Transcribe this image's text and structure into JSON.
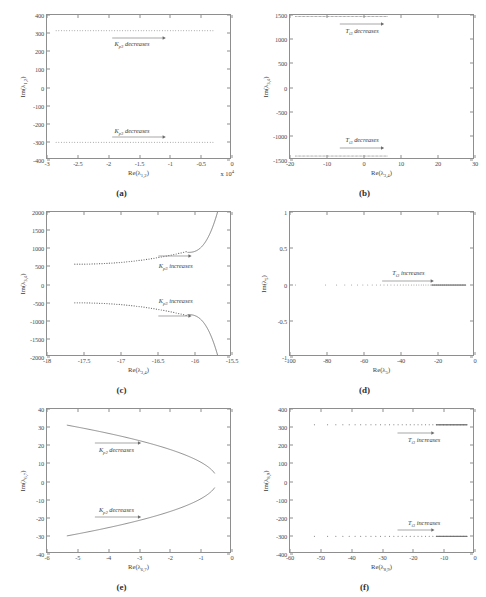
{
  "figure": {
    "panel_count": 6,
    "background": "#ffffff",
    "curve_color": "#6b6b6b",
    "axis_color": "#8e8e8e"
  },
  "panels": [
    {
      "caption": "(a)",
      "xlabel_html": "Re(&lambda;<sub>1,2</sub>)",
      "ylabel_html": "Im(&lambda;<sub>1,2</sub>)",
      "multiplier": "x 10",
      "multiplier_exp": "4",
      "xlim": [
        -3,
        0
      ],
      "ylim": [
        -400,
        400
      ],
      "xticks": [
        -3,
        -2.5,
        -2,
        -1.5,
        -1,
        -0.5,
        0
      ],
      "xticklabels": [
        "-3",
        "-2.5",
        "-2",
        "-1.5",
        "-1",
        "-0.5",
        "0"
      ],
      "yticks": [
        -400,
        -300,
        -200,
        -100,
        0,
        100,
        200,
        300,
        400
      ],
      "yticklabels": [
        "-400",
        "-300",
        "-200",
        "-100",
        "0",
        "100",
        "200",
        "300",
        "400"
      ],
      "annotations": [
        {
          "text_html": "K<sub>p3</sub> decreases",
          "x": -1.62,
          "y": 238,
          "arrow_from_x": -1.95,
          "arrow_to_x": -1.08,
          "arrow_y": 272
        },
        {
          "text_html": "K<sub>p3</sub> decreases",
          "x": -1.62,
          "y": -238,
          "arrow_from_x": -1.95,
          "arrow_to_x": -1.08,
          "arrow_y": -272
        }
      ]
    },
    {
      "caption": "(b)",
      "xlabel_html": "Re(&lambda;<sub>3,4</sub>)",
      "ylabel_html": "Im(&lambda;<sub>3,4</sub>)",
      "multiplier": "",
      "multiplier_exp": "",
      "xlim": [
        -20,
        30
      ],
      "ylim": [
        -1500,
        1500
      ],
      "xticks": [
        -20,
        -10,
        0,
        10,
        20,
        30
      ],
      "xticklabels": [
        "-20",
        "-10",
        "0",
        "10",
        "20",
        "30"
      ],
      "yticks": [
        -1500,
        -1000,
        -500,
        0,
        500,
        1000,
        1500
      ],
      "yticklabels": [
        "-1500",
        "-1000",
        "-500",
        "0",
        "500",
        "1000",
        "1500"
      ],
      "annotations": [
        {
          "text_html": "T<sub>i3</sub> decreases",
          "x": -0.5,
          "y": 1160,
          "arrow_from_x": -6.5,
          "arrow_to_x": 5.5,
          "arrow_y": 1310
        },
        {
          "text_html": "T<sub>i3</sub> decreases",
          "x": -0.5,
          "y": -1090,
          "arrow_from_x": -6.5,
          "arrow_to_x": 5.5,
          "arrow_y": -1245
        }
      ]
    },
    {
      "caption": "(c)",
      "xlabel_html": "Re(&lambda;<sub>3,4</sub>)",
      "ylabel_html": "Im(&lambda;<sub>3,4</sub>)",
      "multiplier": "",
      "multiplier_exp": "",
      "xlim": [
        -18,
        -15.5
      ],
      "ylim": [
        -2000,
        2000
      ],
      "xticks": [
        -18,
        -17.5,
        -17,
        -16.5,
        -16,
        -15.5
      ],
      "xticklabels": [
        "-18",
        "-17.5",
        "-17",
        "-16.5",
        "-16",
        "-15.5"
      ],
      "yticks": [
        -2000,
        -1500,
        -1000,
        -500,
        0,
        500,
        1000,
        1500,
        2000
      ],
      "yticklabels": [
        "-2000",
        "-1500",
        "-1000",
        "-500",
        "0",
        "500",
        "1000",
        "1500",
        "2000"
      ],
      "annotations": [
        {
          "text_html": "K<sub>p3</sub> increases",
          "x": -16.26,
          "y": 510,
          "arrow_from_x": -16.5,
          "arrow_to_x": -16.05,
          "arrow_y": 800
        },
        {
          "text_html": "K<sub>p3</sub> increases",
          "x": -16.26,
          "y": -455,
          "arrow_from_x": -16.5,
          "arrow_to_x": -16.05,
          "arrow_y": -880
        }
      ]
    },
    {
      "caption": "(d)",
      "xlabel_html": "Re(&lambda;<sub>5</sub>)",
      "ylabel_html": "Im(&lambda;<sub>5</sub>)",
      "multiplier": "",
      "multiplier_exp": "",
      "xlim": [
        -100,
        0
      ],
      "ylim": [
        -1,
        1
      ],
      "xticks": [
        -100,
        -80,
        -60,
        -40,
        -20,
        0
      ],
      "xticklabels": [
        "-100",
        "-80",
        "-60",
        "-40",
        "-20",
        "0"
      ],
      "yticks": [
        -1,
        -0.5,
        0,
        0.5,
        1
      ],
      "yticklabels": [
        "-1",
        "-0.5",
        "0",
        "0.5",
        "1"
      ],
      "annotations": [
        {
          "text_html": "T<sub>i3</sub> increases",
          "x": -36,
          "y": 0.155,
          "arrow_from_x": -50,
          "arrow_to_x": -22,
          "arrow_y": 0.055
        }
      ]
    },
    {
      "caption": "(e)",
      "xlabel_html": "Re(&lambda;<sub>6,7</sub>)",
      "ylabel_html": "Im(&lambda;<sub>6,7</sub>)",
      "multiplier": "",
      "multiplier_exp": "",
      "xlim": [
        -6,
        0
      ],
      "ylim": [
        -40,
        40
      ],
      "xticks": [
        -6,
        -5,
        -4,
        -3,
        -2,
        -1,
        0
      ],
      "xticklabels": [
        "-6",
        "-5",
        "-4",
        "-3",
        "-2",
        "-1",
        "0"
      ],
      "yticks": [
        -40,
        -30,
        -20,
        -10,
        0,
        10,
        20,
        30,
        40
      ],
      "yticklabels": [
        "-40",
        "-30",
        "-20",
        "-10",
        "0",
        "10",
        "20",
        "30",
        "40"
      ],
      "annotations": [
        {
          "text_html": "K<sub>p2</sub> decreases",
          "x": -3.75,
          "y": 17.5,
          "arrow_from_x": -4.45,
          "arrow_to_x": -2.95,
          "arrow_y": 21.5
        },
        {
          "text_html": "K<sub>p2</sub> decreases",
          "x": -3.75,
          "y": -15.5,
          "arrow_from_x": -4.45,
          "arrow_to_x": -2.95,
          "arrow_y": -19.5
        }
      ]
    },
    {
      "caption": "(f)",
      "xlabel_html": "Re(&lambda;<sub>8,9</sub>)",
      "ylabel_html": "Im(&lambda;<sub>8,9</sub>)",
      "multiplier": "",
      "multiplier_exp": "",
      "xlim": [
        -60,
        0
      ],
      "ylim": [
        -400,
        400
      ],
      "xticks": [
        -60,
        -50,
        -40,
        -30,
        -20,
        -10,
        0
      ],
      "xticklabels": [
        "-60",
        "-50",
        "-40",
        "-30",
        "-20",
        "-10",
        "0"
      ],
      "yticks": [
        -400,
        -300,
        -200,
        -100,
        0,
        100,
        200,
        300,
        400
      ],
      "yticklabels": [
        "-400",
        "-300",
        "-200",
        "-100",
        "0",
        "100",
        "200",
        "300",
        "400"
      ],
      "annotations": [
        {
          "text_html": "T<sub>i3</sub> increases",
          "x": -16.5,
          "y": 228,
          "arrow_from_x": -25,
          "arrow_to_x": -13,
          "arrow_y": 265
        },
        {
          "text_html": "T<sub>i3</sub> increases",
          "x": -16.5,
          "y": -228,
          "arrow_from_x": -25,
          "arrow_to_x": -13,
          "arrow_y": -265
        }
      ]
    }
  ],
  "chart_data": [
    {
      "panel": "(a)",
      "type": "scatter",
      "title": "",
      "xlabel": "Re(lambda_1,2)  x 10^4",
      "ylabel": "Im(lambda_1,2)",
      "xlim": [
        -3,
        0
      ],
      "ylim": [
        -400,
        400
      ],
      "grid": false,
      "legend": "none",
      "series": [
        {
          "name": "upper branch (Im = +312)",
          "x_start": -2.85,
          "x_end": -0.28,
          "y_value": 312,
          "n_points": 60,
          "marker": "dot"
        },
        {
          "name": "lower branch (Im = -312)",
          "x_start": -2.85,
          "x_end": -0.28,
          "y_value": -312,
          "n_points": 60,
          "marker": "dot"
        }
      ],
      "annotations": [
        "K_p3 decreases",
        "K_p3 decreases"
      ]
    },
    {
      "panel": "(b)",
      "type": "scatter",
      "title": "",
      "xlabel": "Re(lambda_3,4)",
      "ylabel": "Im(lambda_3,4)",
      "xlim": [
        -20,
        30
      ],
      "ylim": [
        -1500,
        1500
      ],
      "grid": false,
      "legend": "none",
      "series": [
        {
          "name": "upper branch (Im ~ +1470)",
          "x_start": -18.5,
          "x_end": 6.5,
          "y_value": 1470,
          "n_points": 70,
          "marker": "dot"
        },
        {
          "name": "lower branch (Im ~ -1460)",
          "x_start": -18.5,
          "x_end": 6.5,
          "y_value": -1460,
          "n_points": 70,
          "marker": "dot"
        }
      ],
      "annotations": [
        "T_i3 decreases",
        "T_i3 decreases"
      ]
    },
    {
      "panel": "(c)",
      "type": "line",
      "title": "",
      "xlabel": "Re(lambda_3,4)",
      "ylabel": "Im(lambda_3,4)",
      "xlim": [
        -18,
        -15.5
      ],
      "ylim": [
        -2000,
        2000
      ],
      "grid": false,
      "legend": "none",
      "series": [
        {
          "name": "upper dotted branch",
          "description": "rises slowly from (-17.6, 540) to (-16.1, 880) then steepens",
          "marker": "dot"
        },
        {
          "name": "upper solid asymptote",
          "description": "solid curve from (-16.05, 870) rising to (-15.67, 2000)",
          "marker": "line"
        },
        {
          "name": "lower dotted branch",
          "description": "falls slowly from (-17.6, -555) to (-16.1, -890)",
          "marker": "dot"
        },
        {
          "name": "lower solid asymptote",
          "description": "solid curve from (-16.05, -890) falling to (-15.67, -2000)",
          "marker": "line"
        }
      ],
      "annotations": [
        "K_p3 increases",
        "K_p3 increases"
      ]
    },
    {
      "panel": "(d)",
      "type": "scatter",
      "title": "",
      "xlabel": "Re(lambda_5)",
      "ylabel": "Im(lambda_5)",
      "xlim": [
        -100,
        0
      ],
      "ylim": [
        -1,
        1
      ],
      "grid": false,
      "legend": "none",
      "series": [
        {
          "name": "real eigenvalue (Im = 0)",
          "x_start": -97,
          "x_end": -4,
          "y_value": -0.02,
          "n_points": 48,
          "marker": "dot",
          "note": "point density increases toward the right, becoming a solid segment from about -20 to -4"
        }
      ],
      "annotations": [
        "T_i3 increases"
      ]
    },
    {
      "panel": "(e)",
      "type": "line",
      "title": "",
      "xlabel": "Re(lambda_6,7)",
      "ylabel": "Im(lambda_6,7)",
      "xlim": [
        -6,
        0
      ],
      "ylim": [
        -40,
        40
      ],
      "grid": false,
      "legend": "none",
      "series": [
        {
          "name": "upper branch",
          "description": "curve from (-5.35, 31) decreasing to (-0.5, 7), opening leftwards",
          "marker": "line"
        },
        {
          "name": "lower branch",
          "description": "curve from (-5.35, -31) increasing to (-0.5, -7), mirror of upper",
          "marker": "line"
        }
      ],
      "annotations": [
        "K_p2 decreases",
        "K_p2 decreases"
      ]
    },
    {
      "panel": "(f)",
      "type": "scatter",
      "title": "",
      "xlabel": "Re(lambda_8,9)",
      "ylabel": "Im(lambda_8,9)",
      "xlim": [
        -60,
        0
      ],
      "ylim": [
        -400,
        400
      ],
      "grid": false,
      "legend": "none",
      "series": [
        {
          "name": "upper branch (Im ~ +312)",
          "x_start": -52,
          "x_end": -2,
          "y_value": 312,
          "n_points": 34,
          "marker": "dot",
          "note": "sparse on the left, dense/solid from about -12 to -2"
        },
        {
          "name": "lower branch (Im ~ -312)",
          "x_start": -52,
          "x_end": -2,
          "y_value": -312,
          "n_points": 34,
          "marker": "dot",
          "note": "sparse on the left, dense/solid from about -12 to -2"
        }
      ],
      "annotations": [
        "T_i3 increases",
        "T_i3 increases"
      ]
    }
  ]
}
